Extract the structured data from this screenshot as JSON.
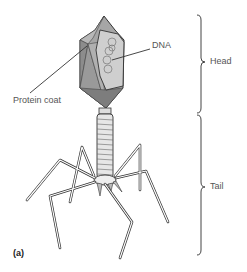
{
  "diagram": {
    "panel_label": "(a)",
    "labels": {
      "dna": "DNA",
      "protein_coat": "Protein coat",
      "head": "Head",
      "tail": "Tail"
    },
    "colors": {
      "capsid_dark": "#8c8c8c",
      "capsid_mid": "#a6a6a6",
      "capsid_light": "#c8c8c8",
      "line": "#333333",
      "label_text": "#555555"
    }
  }
}
